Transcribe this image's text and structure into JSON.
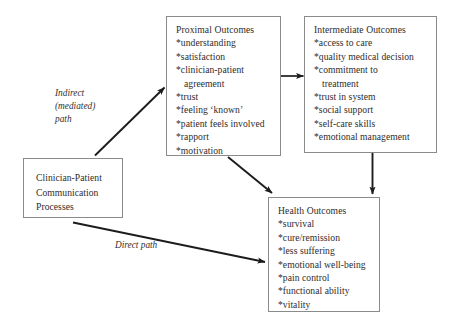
{
  "diagram": {
    "background_color": "#ffffff",
    "border_color": "#8a8a8a",
    "text_color": "#2e2c2b"
  },
  "boxes": {
    "source": {
      "name": "Clinician-Patient Communication Processes",
      "lines": [
        "Clinician-Patient",
        "Communication",
        "Processes"
      ]
    },
    "proximal": {
      "heading": "Proximal Outcomes",
      "items": [
        "*understanding",
        "*satisfaction",
        "*clinician-patient",
        "agreement",
        "*trust",
        "*feeling ‘known’",
        "*patient feels involved",
        "*rapport",
        "*motivation"
      ]
    },
    "intermediate": {
      "heading": "Intermediate Outcomes",
      "items": [
        "*access to care",
        "*quality medical decision",
        "*commitment to",
        "treatment",
        "*trust in system",
        "*social support",
        "*self-care skills",
        "*emotional management"
      ]
    },
    "health": {
      "heading": "Health Outcomes",
      "items": [
        "*survival",
        "*cure/remission",
        "*less suffering",
        "*emotional well-being",
        "*pain control",
        "*functional ability",
        "*vitality"
      ]
    }
  },
  "labels": {
    "indirect": "Indirect\n(mediated)\npath",
    "direct": "Direct path"
  },
  "arrows": [
    {
      "name": "indirect-path-arrow",
      "from": "source",
      "to": "proximal"
    },
    {
      "name": "proximal-to-intermediate-arrow",
      "from": "proximal",
      "to": "intermediate"
    },
    {
      "name": "proximal-to-health-arrow",
      "from": "proximal",
      "to": "health"
    },
    {
      "name": "intermediate-to-health-arrow",
      "from": "intermediate",
      "to": "health"
    },
    {
      "name": "direct-path-arrow",
      "from": "source",
      "to": "health"
    }
  ]
}
